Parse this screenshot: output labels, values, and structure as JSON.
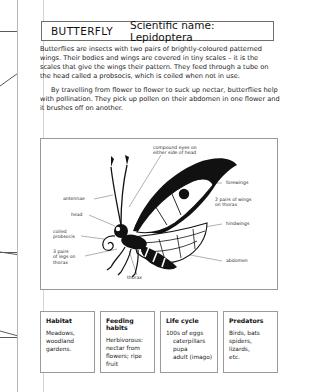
{
  "page": {
    "title_label": "BUTTERFLY",
    "scientific_label": "Scientific name: Lepidoptera"
  },
  "paragraphs": {
    "p1": "Butterflies are insects with two pairs of brightly-coloured patterned wings. Their bodies and wings are covered in tiny scales – it is the scales that give the wings their pattern. They feed through a tube on the head called a probsocis, which is coiled when not in use.",
    "p2": "By travelling from flower to flower to suck up nectar, butterflies help with pollination. They pick up pollen on their abdomen in one flower and it brushes off on another."
  },
  "diagram": {
    "labels": {
      "compound_eyes": "compound eyes on\neither side of head",
      "antennae": "antennae",
      "head": "head",
      "coiled_proboscis": "coiled\nprobsocis",
      "legs": "3 pairs\nof legs on\nthorax",
      "thorax": "thorax",
      "forewings": "forewings",
      "two_pairs_wings": "2 pairs of wings\non thorax",
      "hindwings": "hindwings",
      "abdomen": "abdomen"
    }
  },
  "facts": [
    {
      "title": "Habitat",
      "lines": [
        {
          "text": "Meadows,",
          "indent": false
        },
        {
          "text": "woodland",
          "indent": false
        },
        {
          "text": "gardens.",
          "indent": false
        }
      ]
    },
    {
      "title": "Feeding habits",
      "lines": [
        {
          "text": "Herbivorous:",
          "indent": false
        },
        {
          "text": "nectar from",
          "indent": false
        },
        {
          "text": "flowers; ripe",
          "indent": false
        },
        {
          "text": "fruit",
          "indent": false
        }
      ]
    },
    {
      "title": "Life cycle",
      "lines": [
        {
          "text": "100s of eggs",
          "indent": false
        },
        {
          "text": "caterpillars",
          "indent": true
        },
        {
          "text": "pupa",
          "indent": true
        },
        {
          "text": "adult (imago)",
          "indent": true
        }
      ]
    },
    {
      "title": "Predators",
      "lines": [
        {
          "text": "Birds, bats",
          "indent": false
        },
        {
          "text": "spiders,",
          "indent": false
        },
        {
          "text": "lizards,",
          "indent": false
        },
        {
          "text": "etc.",
          "indent": false
        }
      ]
    }
  ],
  "colors": {
    "page_background": "#ffffff",
    "ink": "#111111",
    "box_border": "#9a9a9a",
    "guide_line": "#5a5a5a"
  }
}
